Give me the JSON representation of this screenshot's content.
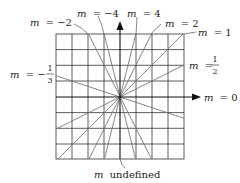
{
  "figure": {
    "grid": {
      "cols": 8,
      "rows": 8,
      "left": 56,
      "top": 34,
      "cell": 15.8
    },
    "origin": {
      "x": 120,
      "y": 97
    },
    "lines": [
      {
        "slope_label": "m = −2",
        "slope": -2
      },
      {
        "slope_label": "m = −4",
        "slope": -4
      },
      {
        "slope_label": "m = 4",
        "slope": 4
      },
      {
        "slope_label": "m = 2",
        "slope": 2
      },
      {
        "slope_label": "m = 1",
        "slope": 1
      },
      {
        "slope_label": "m = 1/2",
        "slope": 0.5
      },
      {
        "slope_label": "m = −1/3",
        "slope": -0.3333
      },
      {
        "slope_label": "m = 0",
        "slope": 0
      },
      {
        "slope_label": "m undefined",
        "slope": null
      }
    ],
    "labels": {
      "m_neg2": {
        "var": "m",
        "eq": "= −2"
      },
      "m_neg4": {
        "var": "m",
        "eq": "= −4"
      },
      "m_4": {
        "var": "m",
        "eq": "= 4"
      },
      "m_2": {
        "var": "m",
        "eq": "= 2"
      },
      "m_1": {
        "var": "m",
        "eq": "= 1"
      },
      "m_half": {
        "var": "m",
        "eq": "=",
        "num": "1",
        "den": "2"
      },
      "m_neg_third": {
        "var": "m",
        "eq": "= −",
        "num": "1",
        "den": "3"
      },
      "m_0": {
        "var": "m",
        "eq": "= 0"
      },
      "m_undef": {
        "var": "m",
        "text": "undefined"
      }
    },
    "colors": {
      "grid": "#333333",
      "lines": "#777777",
      "axes": "#111111"
    }
  }
}
